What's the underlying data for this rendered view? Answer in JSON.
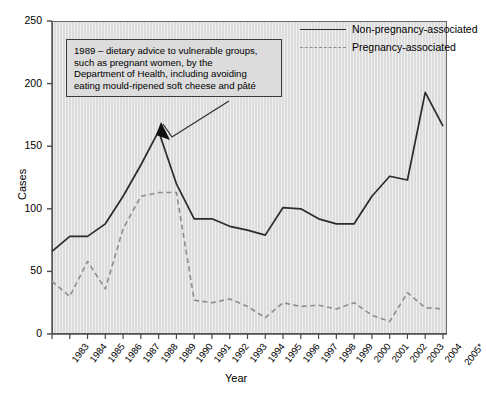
{
  "chart_data": {
    "type": "line",
    "title": "",
    "xlabel": "Year",
    "ylabel": "Cases",
    "ylim": [
      0,
      250
    ],
    "yticks": [
      0,
      50,
      100,
      150,
      200,
      250
    ],
    "grid": false,
    "legend_position": "top-right",
    "categories": [
      "1983",
      "1984",
      "1985",
      "1986",
      "1987",
      "1988",
      "1989",
      "1990",
      "1991",
      "1992",
      "1993",
      "1994",
      "1995",
      "1996",
      "1997",
      "1998",
      "1999",
      "2000",
      "2001",
      "2002",
      "2003",
      "2004",
      "2005*"
    ],
    "series": [
      {
        "name": "Non-pregnancy-associated",
        "style": "solid",
        "color": "#2b2b2b",
        "values": [
          66,
          78,
          78,
          88,
          110,
          135,
          162,
          120,
          92,
          92,
          86,
          83,
          79,
          101,
          100,
          92,
          88,
          88,
          110,
          126,
          123,
          193,
          166
        ]
      },
      {
        "name": "Pregnancy-associated",
        "style": "dashed",
        "color": "#8d8d8d",
        "values": [
          42,
          30,
          58,
          36,
          84,
          110,
          113,
          113,
          27,
          25,
          28,
          22,
          13,
          25,
          22,
          23,
          20,
          25,
          15,
          10,
          33,
          21,
          20
        ]
      }
    ],
    "annotations": [
      {
        "name": "dietary-advice-1989",
        "text": "1989 – dietary advice to vulnerable groups, such as pregnant women, by the Department of Health, including avoiding eating mould-ripened soft cheese and pâté",
        "lines": [
          "1989 – dietary advice to vulnerable groups,",
          "such as pregnant women, by the",
          "Department of Health, including avoiding",
          "eating mould-ripened soft cheese and pâté"
        ],
        "points_to_year": "1989",
        "points_to_value": 150
      }
    ]
  },
  "axes": {
    "y_title": "Cases",
    "x_title": "Year",
    "y_tick_labels": [
      "0",
      "50",
      "100",
      "150",
      "200",
      "250"
    ],
    "x_tick_labels": [
      "1983",
      "1984",
      "1985",
      "1986",
      "1987",
      "1988",
      "1989",
      "1990",
      "1991",
      "1992",
      "1993",
      "1994",
      "1995",
      "1996",
      "1997",
      "1998",
      "1999",
      "2000",
      "2001",
      "2002",
      "2003",
      "2004",
      "2005*"
    ]
  },
  "legend": {
    "items": [
      {
        "label": "Non-pregnancy-associated",
        "style": "solid"
      },
      {
        "label": "Pregnancy-associated",
        "style": "dashed"
      }
    ]
  },
  "colors": {
    "plot_background": "#dcdcdc",
    "axis": "#4a4a4a",
    "series_solid": "#2b2b2b",
    "series_dashed": "#8d8d8d",
    "annotation_border": "#3a3a3a"
  }
}
